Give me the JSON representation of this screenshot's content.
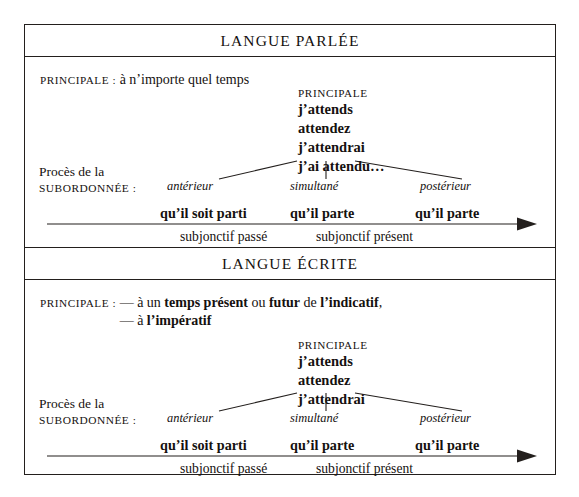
{
  "figure": {
    "panels": [
      {
        "id": "spoken",
        "header": "LANGUE PARLÉE",
        "principale_label": "PRINCIPALE :",
        "principale_rules": [
          "à n’importe quel temps"
        ],
        "main_clause": {
          "heading": "PRINCIPALE",
          "verbs": [
            "j’attends",
            "attendez",
            "j’attendrai",
            "j’ai attendu…"
          ]
        },
        "subordinate_label": {
          "line1": "Procès de la",
          "line2": "SUBORDONNÉE :"
        },
        "aspects": [
          "antérieur",
          "simultané",
          "postérieur"
        ],
        "forms": [
          "qu’il soit parti",
          "qu’il parte",
          "qu’il parte"
        ],
        "tense_bands": [
          "subjonctif passé",
          "subjonctif présent"
        ]
      },
      {
        "id": "written",
        "header": "LANGUE ÉCRITE",
        "principale_label": "PRINCIPALE :",
        "principale_rules": [
          "— à un temps présent ou futur de l’indicatif,",
          "— à l’impératif"
        ],
        "main_clause": {
          "heading": "PRINCIPALE",
          "verbs": [
            "j’attends",
            "attendez",
            "j’attendrai"
          ]
        },
        "subordinate_label": {
          "line1": "Procès de la",
          "line2": "SUBORDONNÉE :"
        },
        "aspects": [
          "antérieur",
          "simultané",
          "postérieur"
        ],
        "forms": [
          "qu’il soit parti",
          "qu’il parte",
          "qu’il parte"
        ],
        "tense_bands": [
          "subjonctif passé",
          "subjonctif présent"
        ]
      }
    ],
    "colors": {
      "ink": "#231f1d",
      "background": "#ffffff"
    }
  }
}
